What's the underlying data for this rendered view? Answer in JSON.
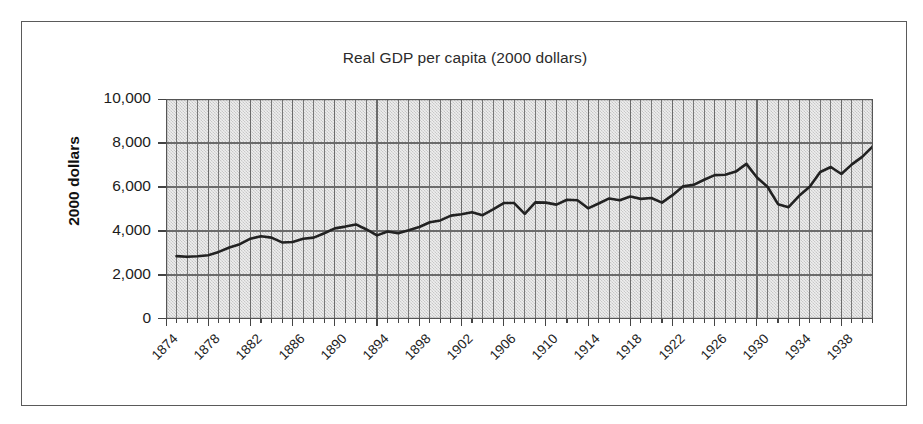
{
  "figure": {
    "background_color": "#ffffff",
    "frame_color": "#5a5a5a",
    "plot_background_color": "#d9d9d9",
    "line_color": "#222222"
  },
  "chart_data": {
    "type": "line",
    "title": "Real GDP per capita (2000 dollars)",
    "xlabel": "",
    "ylabel": "2000 dollars",
    "ylim": [
      0,
      10000
    ],
    "xlim": [
      1874,
      1941
    ],
    "grid": "both",
    "legend": "none",
    "ytick_labels": [
      "10,000",
      "8,000",
      "6,000",
      "4,000",
      "2,000",
      "0"
    ],
    "ytick_values": [
      10000,
      8000,
      6000,
      4000,
      2000,
      0
    ],
    "xtick_labels": [
      "1874",
      "1878",
      "1882",
      "1886",
      "1890",
      "1894",
      "1898",
      "1902",
      "1906",
      "1910",
      "1914",
      "1918",
      "1922",
      "1926",
      "1930",
      "1934",
      "1938"
    ],
    "xtick_values": [
      1874,
      1878,
      1882,
      1886,
      1890,
      1894,
      1898,
      1902,
      1906,
      1910,
      1914,
      1918,
      1922,
      1926,
      1930,
      1934,
      1938
    ],
    "series": [
      {
        "name": "Real GDP per capita",
        "x": [
          1875,
          1876,
          1877,
          1878,
          1879,
          1880,
          1881,
          1882,
          1883,
          1884,
          1885,
          1886,
          1887,
          1888,
          1889,
          1890,
          1891,
          1892,
          1893,
          1894,
          1895,
          1896,
          1897,
          1898,
          1899,
          1900,
          1901,
          1902,
          1903,
          1904,
          1905,
          1906,
          1907,
          1908,
          1909,
          1910,
          1911,
          1912,
          1913,
          1914,
          1915,
          1916,
          1917,
          1918,
          1919,
          1920,
          1921,
          1922,
          1923,
          1924,
          1925,
          1926,
          1927,
          1928,
          1929,
          1930,
          1931,
          1932,
          1933,
          1934,
          1935,
          1936,
          1937,
          1938,
          1939,
          1940,
          1941
        ],
        "values": [
          2860,
          2830,
          2850,
          2900,
          3050,
          3250,
          3400,
          3650,
          3760,
          3700,
          3480,
          3500,
          3650,
          3700,
          3900,
          4120,
          4200,
          4300,
          4070,
          3800,
          3980,
          3900,
          4030,
          4180,
          4400,
          4480,
          4700,
          4760,
          4850,
          4720,
          4980,
          5270,
          5270,
          4780,
          5300,
          5290,
          5200,
          5420,
          5400,
          5030,
          5250,
          5480,
          5400,
          5570,
          5460,
          5500,
          5290,
          5630,
          6030,
          6100,
          6330,
          6540,
          6560,
          6700,
          7050,
          6430,
          6010,
          5220,
          5080,
          5600,
          6010,
          6680,
          6910,
          6590,
          7030,
          7380,
          7850
        ]
      }
    ]
  }
}
